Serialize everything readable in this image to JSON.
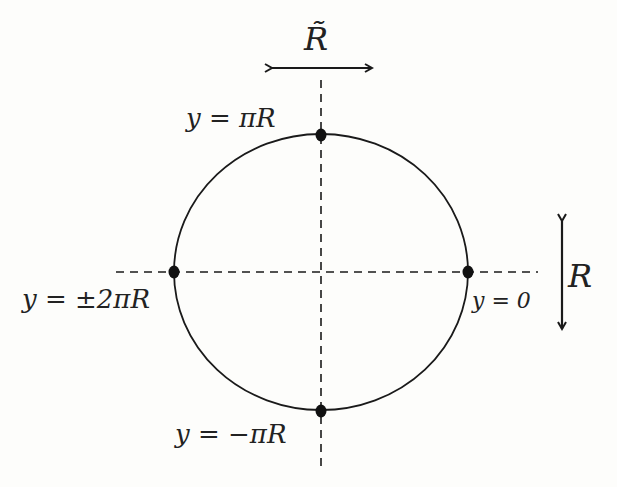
{
  "diagram": {
    "type": "compactified circle (orbifold) with marked points",
    "labels": {
      "top_arrow": "R̃",
      "right_arrow": "R",
      "top_point": "y = πR",
      "left_point": "y = ±2πR",
      "right_point": "y = 0",
      "bottom_point": "y = −πR"
    },
    "colors": {
      "stroke": "#1a1a1a",
      "background": "#fdfdfb",
      "point": "#111111"
    },
    "circle": {
      "cx": 321,
      "cy": 272,
      "rx": 147,
      "ry": 138
    },
    "points": [
      {
        "name": "top",
        "x": 321,
        "y": 134
      },
      {
        "name": "left",
        "x": 174,
        "y": 272
      },
      {
        "name": "right",
        "x": 468,
        "y": 272
      },
      {
        "name": "bottom",
        "x": 321,
        "y": 411
      }
    ]
  }
}
